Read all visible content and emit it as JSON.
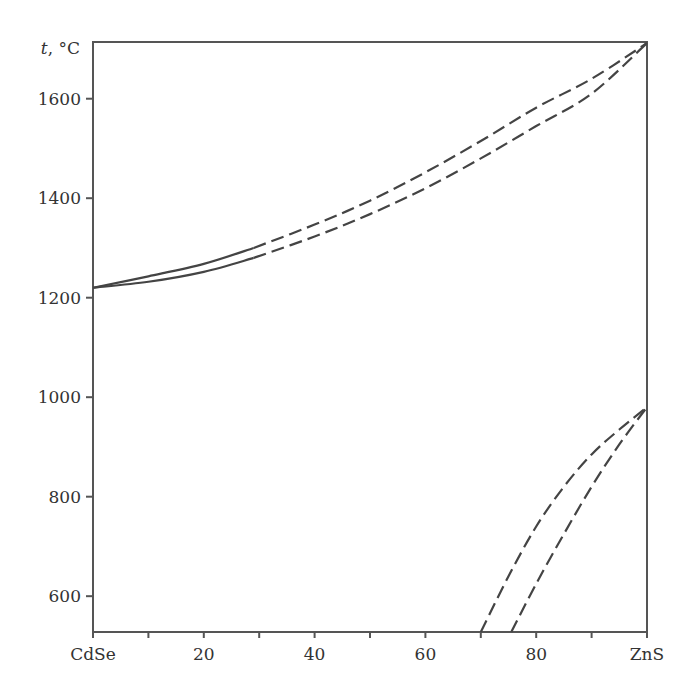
{
  "chart_data": {
    "type": "line",
    "title": "",
    "xlabel": "",
    "ylabel": "t, °C",
    "ylabel_italic_part": "t",
    "ylabel_unit": ", °C",
    "xlim": [
      0,
      100
    ],
    "ylim": [
      528,
      1714
    ],
    "grid": false,
    "legend": null,
    "x_ticks": [
      0,
      10,
      20,
      30,
      40,
      50,
      60,
      70,
      80,
      90,
      100
    ],
    "x_tick_labels": [
      {
        "value": 0,
        "label": "CdSe"
      },
      {
        "value": 20,
        "label": "20"
      },
      {
        "value": 40,
        "label": "40"
      },
      {
        "value": 60,
        "label": "60"
      },
      {
        "value": 80,
        "label": "80"
      },
      {
        "value": 100,
        "label": "ZnS"
      }
    ],
    "y_tick_labels": [
      {
        "value": 600,
        "label": "600"
      },
      {
        "value": 800,
        "label": "800"
      },
      {
        "value": 1000,
        "label": "1000"
      },
      {
        "value": 1200,
        "label": "1200"
      },
      {
        "value": 1400,
        "label": "1400"
      },
      {
        "value": 1600,
        "label": "1600"
      }
    ],
    "x_unit": "mol% ZnS (CdSe–ZnS system)",
    "series": [
      {
        "name": "liquidus (upper)",
        "style": "solid to 29%, dashed beyond",
        "solid_until": 29,
        "x": [
          0,
          10,
          20,
          29,
          40,
          50,
          60,
          70,
          80,
          90,
          100
        ],
        "y": [
          1220,
          1243,
          1268,
          1300,
          1347,
          1395,
          1452,
          1515,
          1582,
          1640,
          1712
        ]
      },
      {
        "name": "solidus (upper)",
        "style": "solid to 29%, dashed beyond",
        "solid_until": 29,
        "x": [
          0,
          10,
          20,
          29,
          40,
          50,
          60,
          70,
          80,
          90,
          100
        ],
        "y": [
          1220,
          1232,
          1252,
          1280,
          1323,
          1368,
          1420,
          1480,
          1545,
          1610,
          1712
        ]
      },
      {
        "name": "transformation boundary (upper)",
        "style": "dashed",
        "x": [
          70,
          75,
          80,
          85,
          90,
          95,
          100
        ],
        "y": [
          528,
          640,
          740,
          820,
          885,
          935,
          980
        ]
      },
      {
        "name": "transformation boundary (lower)",
        "style": "dashed",
        "x": [
          75.5,
          80,
          85,
          90,
          95,
          100
        ],
        "y": [
          528,
          625,
          725,
          820,
          905,
          980
        ]
      }
    ]
  }
}
